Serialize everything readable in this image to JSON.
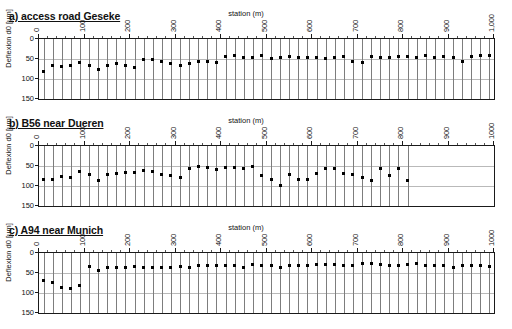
{
  "figure": {
    "axis_title": "station (m)",
    "ylabel": "Deflexion d0 [µm]"
  },
  "panels": [
    {
      "id": "a",
      "title": "a) access road Geseke"
    },
    {
      "id": "b",
      "title": "b) B56 near Dueren"
    },
    {
      "id": "c",
      "title": "c) A94 near Munich"
    }
  ],
  "chart_data": [
    {
      "type": "scatter",
      "title": "a) access road Geseke",
      "xlabel": "station (m)",
      "ylabel": "Deflexion d0 [µm]",
      "xlim": [
        0,
        1000
      ],
      "ylim": [
        0,
        150
      ],
      "y_inverted": true,
      "xticks": [
        0,
        100,
        200,
        300,
        400,
        500,
        600,
        700,
        800,
        900,
        1000
      ],
      "xticklabels": [
        "0",
        "100",
        "200",
        "300",
        "400",
        "500",
        "600",
        "700",
        "800",
        "900",
        "1,000"
      ],
      "yticks": [
        0,
        50,
        100,
        150
      ],
      "yticklabels": [
        "0",
        "50",
        "100",
        "150"
      ],
      "grid": "horizontal",
      "errorbars": true,
      "errorbar_range": [
        0,
        150
      ],
      "x": [
        10,
        30,
        50,
        70,
        90,
        110,
        130,
        150,
        170,
        190,
        210,
        230,
        250,
        270,
        290,
        310,
        330,
        350,
        370,
        390,
        410,
        430,
        450,
        470,
        490,
        510,
        530,
        550,
        570,
        590,
        610,
        630,
        650,
        670,
        690,
        710,
        730,
        750,
        770,
        790,
        810,
        830,
        850,
        870,
        890,
        910,
        930,
        950,
        970,
        990
      ],
      "y": [
        81,
        66,
        68,
        65,
        58,
        67,
        77,
        66,
        61,
        66,
        72,
        51,
        52,
        55,
        61,
        65,
        62,
        57,
        55,
        59,
        44,
        41,
        46,
        45,
        42,
        48,
        45,
        43,
        47,
        46,
        47,
        48,
        47,
        43,
        55,
        59,
        44,
        45,
        47,
        44,
        44,
        46,
        42,
        47,
        44,
        45,
        57,
        44,
        40,
        42
      ]
    },
    {
      "type": "scatter",
      "title": "b) B56 near Dueren",
      "xlabel": "station (m)",
      "ylabel": "Deflexion d0 [µm]",
      "xlim": [
        0,
        1000
      ],
      "ylim": [
        0,
        150
      ],
      "y_inverted": true,
      "xticks": [
        0,
        100,
        200,
        300,
        400,
        500,
        600,
        700,
        800,
        900,
        1000
      ],
      "xticklabels": [
        "0",
        "100",
        "200",
        "300",
        "400",
        "500",
        "600",
        "700",
        "800",
        "900",
        "1000"
      ],
      "yticks": [
        0,
        50,
        100,
        150
      ],
      "yticklabels": [
        "0",
        "50",
        "100",
        "150"
      ],
      "grid": "horizontal",
      "errorbars": true,
      "errorbar_range": [
        0,
        150
      ],
      "x": [
        10,
        30,
        50,
        70,
        90,
        110,
        130,
        150,
        170,
        190,
        210,
        230,
        250,
        270,
        290,
        310,
        330,
        350,
        370,
        390,
        410,
        430,
        450,
        470,
        490,
        510,
        530,
        550,
        570,
        590,
        610,
        630,
        650,
        670,
        690,
        710,
        730,
        750,
        770,
        790,
        810
      ],
      "y": [
        84,
        83,
        77,
        78,
        64,
        72,
        86,
        71,
        68,
        65,
        67,
        60,
        63,
        71,
        74,
        78,
        55,
        50,
        53,
        58,
        53,
        53,
        56,
        52,
        73,
        84,
        98,
        71,
        83,
        84,
        69,
        56,
        56,
        69,
        71,
        78,
        85,
        56,
        73,
        55,
        85
      ]
    },
    {
      "type": "scatter",
      "title": "c) A94 near Munich",
      "xlabel": "station (m)",
      "ylabel": "Deflexion d0 [µm]",
      "xlim": [
        0,
        1000
      ],
      "ylim": [
        0,
        150
      ],
      "y_inverted": true,
      "xticks": [
        0,
        100,
        200,
        300,
        400,
        500,
        600,
        700,
        800,
        900,
        1000
      ],
      "xticklabels": [
        "0",
        "100",
        "200",
        "300",
        "400",
        "500",
        "600",
        "700",
        "800",
        "900",
        "1000"
      ],
      "yticks": [
        0,
        50,
        100,
        150
      ],
      "yticklabels": [
        "0",
        "50",
        "100",
        "150"
      ],
      "grid": "horizontal",
      "errorbars": true,
      "errorbar_range": [
        0,
        150
      ],
      "x": [
        10,
        30,
        50,
        70,
        90,
        110,
        130,
        150,
        170,
        190,
        210,
        230,
        250,
        270,
        290,
        310,
        330,
        350,
        370,
        390,
        410,
        430,
        450,
        470,
        490,
        510,
        530,
        550,
        570,
        590,
        610,
        630,
        650,
        670,
        690,
        710,
        730,
        750,
        770,
        790,
        810,
        830,
        850,
        870,
        890,
        910,
        930,
        950,
        970,
        990
      ],
      "y": [
        69,
        73,
        85,
        88,
        81,
        34,
        44,
        36,
        37,
        37,
        33,
        35,
        35,
        35,
        37,
        33,
        35,
        32,
        31,
        32,
        31,
        30,
        36,
        29,
        31,
        30,
        37,
        32,
        30,
        30,
        29,
        29,
        29,
        32,
        30,
        27,
        25,
        29,
        30,
        30,
        29,
        25,
        31,
        32,
        32,
        35,
        31,
        30,
        30,
        33
      ]
    }
  ]
}
